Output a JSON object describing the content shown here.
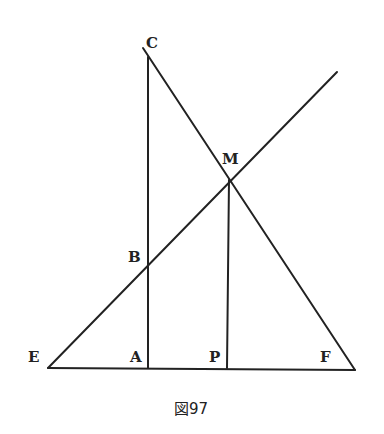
{
  "figure": {
    "caption": "図97",
    "points": {
      "C": {
        "label": "C",
        "x": 148,
        "y": 57
      },
      "M": {
        "label": "M",
        "x": 229,
        "y": 180
      },
      "B": {
        "label": "B",
        "x": 148,
        "y": 265
      },
      "E": {
        "label": "E",
        "x": 48,
        "y": 368
      },
      "A": {
        "label": "A",
        "x": 148,
        "y": 368
      },
      "P": {
        "label": "P",
        "x": 227,
        "y": 368
      },
      "F": {
        "label": "F",
        "x": 355,
        "y": 370
      }
    },
    "segments": [
      {
        "name": "base-EF",
        "from": "E",
        "to": "F"
      },
      {
        "name": "segment-CA",
        "from": "C",
        "to": "A"
      },
      {
        "name": "segment-MP",
        "from": "M",
        "to": "P"
      },
      {
        "name": "segment-CF",
        "from": "C",
        "to": "F"
      },
      {
        "name": "ray-E-through-B-M",
        "from": "E",
        "to": "end"
      }
    ],
    "ray_end": {
      "x": 337,
      "y": 72
    },
    "line_color": "#222222"
  }
}
